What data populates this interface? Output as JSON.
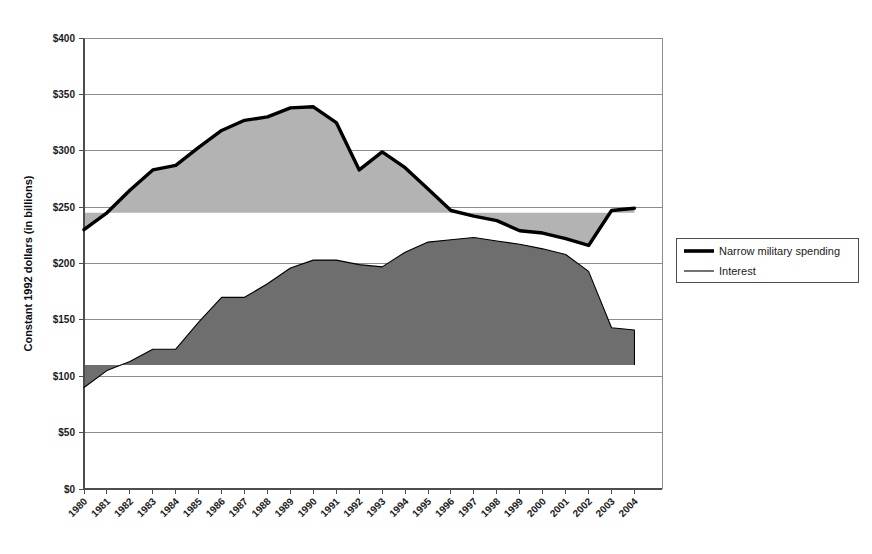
{
  "chart_data": {
    "type": "area",
    "title": "",
    "xlabel": "",
    "ylabel": "Constant 1992 dollars (in billions)",
    "ylim": [
      0,
      400
    ],
    "ytick_values": [
      0,
      50,
      100,
      150,
      200,
      250,
      300,
      350,
      400
    ],
    "ytick_labels": [
      "$0",
      "$50",
      "$100",
      "$150",
      "$200",
      "$250",
      "$300",
      "$350",
      "$400"
    ],
    "grid": true,
    "legend_position": "right",
    "categories": [
      1980,
      1981,
      1982,
      1983,
      1984,
      1985,
      1986,
      1987,
      1988,
      1989,
      1990,
      1991,
      1992,
      1993,
      1994,
      1995,
      1996,
      1997,
      1998,
      1999,
      2000,
      2001,
      2002,
      2003,
      2004
    ],
    "xtick_labels": [
      "1980",
      "1981",
      "1982",
      "1983",
      "1984",
      "1985",
      "1986",
      "1987",
      "1988",
      "1989",
      "1990",
      "1991",
      "1992",
      "1993",
      "1994",
      "1995",
      "1996",
      "1997",
      "1998",
      "1999",
      "2000",
      "2001",
      "2002",
      "2003",
      "2004"
    ],
    "series": [
      {
        "name": "Narrow military spending",
        "style": "thick-line",
        "color": "#000000",
        "fill_color": "#b3b3b3",
        "fill_baseline": 245,
        "values": [
          230,
          245,
          265,
          283,
          287,
          303,
          318,
          327,
          330,
          338,
          339,
          325,
          283,
          299,
          285,
          266,
          247,
          242,
          238,
          229,
          227,
          222,
          216,
          247,
          249
        ]
      },
      {
        "name": "Interest",
        "style": "thin-line",
        "color": "#000000",
        "fill_color": "#6e6e6e",
        "fill_baseline": 110,
        "values": [
          90,
          105,
          113,
          124,
          124,
          148,
          170,
          170,
          182,
          196,
          203,
          203,
          199,
          197,
          210,
          219,
          221,
          223,
          220,
          217,
          213,
          208,
          193,
          143,
          141
        ]
      }
    ]
  },
  "legend": {
    "items": [
      {
        "label": "Narrow military spending",
        "marker": "thick-line"
      },
      {
        "label": "Interest",
        "marker": "thin-line"
      }
    ]
  },
  "axes": {
    "y_title": "Constant 1992 dollars (in billions)"
  },
  "colors": {
    "military_fill": "#b3b3b3",
    "interest_fill": "#6e6e6e",
    "line": "#000000",
    "grid": "#8c8c8c",
    "axis": "#4d4d4d"
  }
}
